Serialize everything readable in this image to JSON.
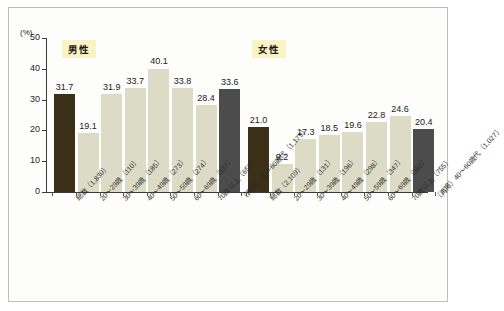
{
  "chart_data": {
    "type": "bar",
    "title": "",
    "xlabel": "",
    "ylabel": "(%)",
    "ylim": [
      0,
      50
    ],
    "yticks": [
      "0",
      "10",
      "20",
      "30",
      "40",
      "50"
    ],
    "grid": false,
    "legend_position": "none",
    "groups": [
      {
        "name": "男性",
        "categories": [
          "総数（1,830）",
          "20～29歳（110）",
          "30～39歳（185）",
          "40～49歳（273）",
          "50～59歳（274）",
          "60～69歳（337）",
          "70歳以上（651）",
          "（再掲）20～60歳代（1,179）"
        ],
        "values": [
          31.7,
          19.1,
          31.9,
          33.7,
          40.1,
          33.8,
          28.4,
          33.6
        ],
        "value_labels": [
          "31.7",
          "19.1",
          "31.9",
          "33.7",
          "40.1",
          "33.8",
          "28.4",
          "33.6"
        ],
        "bar_styles": [
          "total",
          "mid",
          "mid",
          "mid",
          "mid",
          "mid",
          "mid",
          "recap"
        ]
      },
      {
        "name": "女性",
        "categories": [
          "総数（2,109）",
          "20～29歳（131）",
          "30～39歳（196）",
          "40～49歳（298）",
          "50～59歳（347）",
          "60～69歳（382）",
          "70歳以上（755）",
          "（再掲）40～60歳代（1,027）"
        ],
        "values": [
          21.0,
          9.2,
          17.3,
          18.5,
          19.6,
          22.8,
          24.6,
          20.4
        ],
        "value_labels": [
          "21.0",
          "9.2",
          "17.3",
          "18.5",
          "19.6",
          "22.8",
          "24.6",
          "20.4"
        ],
        "bar_styles": [
          "total",
          "mid",
          "mid",
          "mid",
          "mid",
          "mid",
          "mid",
          "recap"
        ]
      }
    ],
    "colors": {
      "bar_total": "#3b2f18",
      "bar_mid": "#dcdcc6",
      "bar_recap": "#4c4c4c",
      "badge_background": "#fbf3c4",
      "axis": "#3a3a3a",
      "frame": "#bdbdb5",
      "background": "#fdfdfb"
    }
  }
}
